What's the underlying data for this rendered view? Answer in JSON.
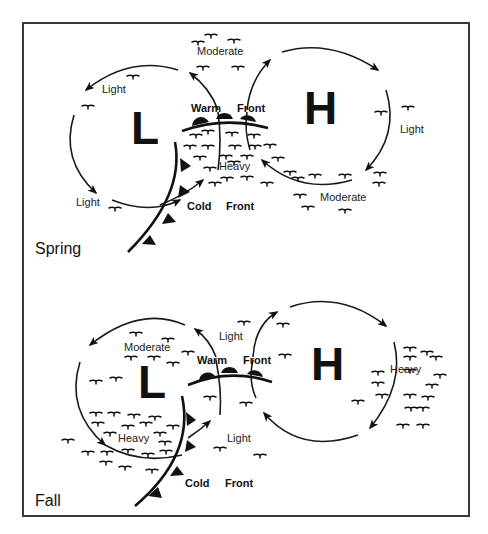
{
  "panels": [
    {
      "season": "Spring",
      "low_label": "L",
      "high_label": "H",
      "warm_front": {
        "word1": "Warm",
        "word2": "Front"
      },
      "cold_front": {
        "word1": "Cold",
        "word2": "Front"
      },
      "intensity_labels": {
        "top_center": "Moderate",
        "low_upper_left": "Light",
        "low_lower_left": "Light",
        "frontal_zone": "Heavy",
        "high_right": "Light",
        "high_bottom": "Moderate"
      }
    },
    {
      "season": "Fall",
      "low_label": "L",
      "high_label": "H",
      "warm_front": {
        "word1": "Warm",
        "word2": "Front"
      },
      "cold_front": {
        "word1": "Cold",
        "word2": "Front"
      },
      "intensity_labels": {
        "low_top": "Moderate",
        "low_bottom": "Heavy",
        "warm_sector_top": "Light",
        "warm_sector_bottom": "Light",
        "high_right": "Heavy"
      }
    }
  ],
  "legend": {
    "icon": "precipitation-gull-symbol",
    "meaning": "precipitation / cloud marks, density indicates intensity"
  },
  "colors": {
    "ink": "#111111",
    "frame": "#3a3a3a",
    "background": "#ffffff"
  }
}
